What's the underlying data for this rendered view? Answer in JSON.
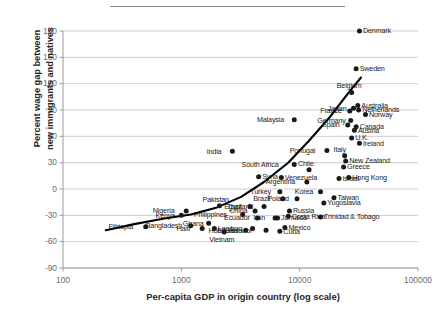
{
  "figure": {
    "top_rule": "horizontal-divider"
  },
  "chart_data": {
    "type": "scatter",
    "title": "",
    "xlabel": "Per-capita GDP in origin country (log scale)",
    "ylabel": "Percent wage gap between new immigrants and natives",
    "ylabel_line1": "Percent wage gap between",
    "ylabel_line2": "new immigrants and natives",
    "xscale": "log",
    "xlim": [
      100,
      100000
    ],
    "ylim": [
      -90,
      180
    ],
    "xticks": [
      100,
      1000,
      10000,
      100000
    ],
    "xtick_labels": [
      "100",
      "1000",
      "10000",
      "100000"
    ],
    "yticks": [
      180,
      150,
      120,
      90,
      60,
      30,
      0,
      -30,
      -60,
      -90
    ],
    "ytick_labels": [
      "180",
      "150",
      "120",
      "90",
      "60",
      "30",
      "0",
      "-30",
      "-60",
      "-90"
    ],
    "grid": "horizontal",
    "legend": "none",
    "marker_color": "#1a1a1a",
    "trendline_color": "#000000",
    "trendline": {
      "description": "fitted increasing curve",
      "points": [
        [
          230,
          -47
        ],
        [
          400,
          -40
        ],
        [
          700,
          -34
        ],
        [
          1200,
          -29
        ],
        [
          2000,
          -21
        ],
        [
          3200,
          -9
        ],
        [
          5000,
          8
        ],
        [
          8000,
          30
        ],
        [
          12000,
          55
        ],
        [
          18000,
          82
        ],
        [
          26000,
          110
        ],
        [
          33000,
          127
        ]
      ]
    },
    "points": [
      {
        "label": "Denmark",
        "x": 32000,
        "y": 180,
        "label_pos": "right"
      },
      {
        "label": "Sweden",
        "x": 30000,
        "y": 137,
        "label_pos": "right"
      },
      {
        "label": "Belgium",
        "x": 27500,
        "y": 110,
        "label_pos": "above"
      },
      {
        "label": "Japan",
        "x": 28500,
        "y": 92,
        "label_pos": "left"
      },
      {
        "label": "Australia",
        "x": 31000,
        "y": 95,
        "label_pos": "right"
      },
      {
        "label": "Netherlands",
        "x": 31500,
        "y": 90,
        "label_pos": "right"
      },
      {
        "label": "France",
        "x": 26500,
        "y": 89,
        "label_pos": "left"
      },
      {
        "label": "Norway",
        "x": 36000,
        "y": 85,
        "label_pos": "right"
      },
      {
        "label": "Germany",
        "x": 27000,
        "y": 78,
        "label_pos": "left"
      },
      {
        "label": "Malaysia",
        "x": 9000,
        "y": 79,
        "label_pos": "left"
      },
      {
        "label": "Spain",
        "x": 25500,
        "y": 73,
        "label_pos": "left"
      },
      {
        "label": "Canada",
        "x": 30000,
        "y": 71,
        "label_pos": "right"
      },
      {
        "label": "Austria",
        "x": 29000,
        "y": 67,
        "label_pos": "right"
      },
      {
        "label": "U.K.",
        "x": 27500,
        "y": 58,
        "label_pos": "right"
      },
      {
        "label": "Ireland",
        "x": 32000,
        "y": 52,
        "label_pos": "right"
      },
      {
        "label": "Portugal",
        "x": 17000,
        "y": 44,
        "label_pos": "left"
      },
      {
        "label": "Italy",
        "x": 24000,
        "y": 38,
        "label_pos": "above"
      },
      {
        "label": "India",
        "x": 2700,
        "y": 43,
        "label_pos": "left"
      },
      {
        "label": "New Zealand",
        "x": 24500,
        "y": 32,
        "label_pos": "right"
      },
      {
        "label": "South Africa",
        "x": 9000,
        "y": 28,
        "label_pos": "left"
      },
      {
        "label": "Greece",
        "x": 23500,
        "y": 25,
        "label_pos": "right"
      },
      {
        "label": "Chile",
        "x": 12000,
        "y": 22,
        "label_pos": "above"
      },
      {
        "label": "Syria",
        "x": 4500,
        "y": 14,
        "label_pos": "right"
      },
      {
        "label": "Venezuela",
        "x": 7000,
        "y": 13,
        "label_pos": "right"
      },
      {
        "label": "Israel",
        "x": 21500,
        "y": 12,
        "label_pos": "right"
      },
      {
        "label": "Hong Kong",
        "x": 26000,
        "y": 13,
        "label_pos": "right"
      },
      {
        "label": "Argentina",
        "x": 11500,
        "y": 8,
        "label_pos": "left"
      },
      {
        "label": "Turkey",
        "x": 6800,
        "y": -3,
        "label_pos": "left"
      },
      {
        "label": "Korea",
        "x": 15000,
        "y": -3,
        "label_pos": "left"
      },
      {
        "label": "Brazil",
        "x": 7200,
        "y": -11,
        "label_pos": "left"
      },
      {
        "label": "Poland",
        "x": 9500,
        "y": -11,
        "label_pos": "left"
      },
      {
        "label": "Taiwan",
        "x": 19500,
        "y": -10,
        "label_pos": "right"
      },
      {
        "label": "Yugoslavia",
        "x": 16000,
        "y": -16,
        "label_pos": "right"
      },
      {
        "label": "Pakistan",
        "x": 2100,
        "y": -19,
        "label_pos": "above"
      },
      {
        "label": "Egypt",
        "x": 3800,
        "y": -20,
        "label_pos": "left"
      },
      {
        "label": "Thailand",
        "x": 5000,
        "y": -20,
        "label_pos": "left"
      },
      {
        "label": "Nigeria",
        "x": 1100,
        "y": -25,
        "label_pos": "left"
      },
      {
        "label": "China",
        "x": 4200,
        "y": -25,
        "label_pos": "left"
      },
      {
        "label": "Russia",
        "x": 8200,
        "y": -25,
        "label_pos": "right"
      },
      {
        "label": "Kenya",
        "x": 1000,
        "y": -30,
        "label_pos": "left"
      },
      {
        "label": "Philippines",
        "x": 3300,
        "y": -29,
        "label_pos": "left"
      },
      {
        "label": "Costa Rica",
        "x": 8000,
        "y": -31,
        "label_pos": "right"
      },
      {
        "label": "Jamaica",
        "x": 6500,
        "y": -33,
        "label_pos": "right"
      },
      {
        "label": "Trinidad & Tobago",
        "x": 15000,
        "y": -32,
        "label_pos": "right"
      },
      {
        "label": "Ecuador",
        "x": 4400,
        "y": -33,
        "label_pos": "left"
      },
      {
        "label": "Iran",
        "x": 6200,
        "y": -33,
        "label_pos": "left"
      },
      {
        "label": "Ghana",
        "x": 1700,
        "y": -39,
        "label_pos": "left"
      },
      {
        "label": "Bangladesh",
        "x": 1200,
        "y": -42,
        "label_pos": "left"
      },
      {
        "label": "Ethiopia",
        "x": 500,
        "y": -43,
        "label_pos": "left"
      },
      {
        "label": "Haiti",
        "x": 1500,
        "y": -45,
        "label_pos": "left"
      },
      {
        "label": "Laos",
        "x": 1900,
        "y": -45,
        "label_pos": "right"
      },
      {
        "label": "Iraq",
        "x": 4000,
        "y": -45,
        "label_pos": "left"
      },
      {
        "label": "Vietnam",
        "x": 2300,
        "y": -49,
        "label_pos": "below"
      },
      {
        "label": "Honduras",
        "x": 3500,
        "y": -47,
        "label_pos": "left"
      },
      {
        "label": "El Salvador",
        "x": 5200,
        "y": -47,
        "label_pos": "left"
      },
      {
        "label": "Mexico",
        "x": 7500,
        "y": -44,
        "label_pos": "right"
      },
      {
        "label": "Cuba",
        "x": 6800,
        "y": -48,
        "label_pos": "right"
      }
    ]
  }
}
